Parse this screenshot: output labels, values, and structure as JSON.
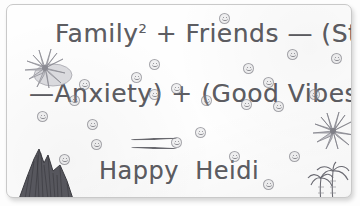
{
  "note": {
    "medium": "handwritten-pencil-note",
    "lines": [
      {
        "id": "line1",
        "text": "Family2 + Friends — (Stress"
      },
      {
        "id": "line2",
        "text": "—Anxiety) + (Good Vibes"
      },
      {
        "id": "line3",
        "text": "="
      },
      {
        "id": "line4",
        "text": "Happy Heidi"
      }
    ],
    "line1_base": "Family",
    "line1_superscript": "2",
    "line1_rest": " + Friends — (Stress",
    "line2_text": "—Anxiety) + (Good Vibes",
    "line4_text": "Happy  Heidi",
    "equation_plain": "Family² + Friends — (Stress — Anxiety) + (Good Vibes = Happy Heidi",
    "ink_color": "#5d5d62",
    "paper_color": "#fefefe",
    "border_color": "#c9c9c9"
  },
  "drawings": [
    {
      "name": "lotus-flower-left",
      "label": "water lily flower with leaf pad"
    },
    {
      "name": "lotus-flower-right",
      "label": "water lily flower"
    },
    {
      "name": "mountain",
      "label": "shaded rocky mountain peak"
    },
    {
      "name": "palm-trees",
      "label": "pair of palm trees"
    }
  ],
  "stamps": {
    "label": "smiley-face stamp",
    "count": 24,
    "positions": [
      [
        78,
        80
      ],
      [
        218,
        14
      ],
      [
        286,
        50
      ],
      [
        330,
        54
      ],
      [
        242,
        64
      ],
      [
        240,
        100
      ],
      [
        148,
        60
      ],
      [
        130,
        73
      ],
      [
        68,
        96
      ],
      [
        262,
        78
      ],
      [
        272,
        102
      ],
      [
        170,
        84
      ],
      [
        86,
        120
      ],
      [
        90,
        140
      ],
      [
        308,
        90
      ],
      [
        194,
        128
      ],
      [
        58,
        155
      ],
      [
        170,
        138
      ],
      [
        228,
        152
      ],
      [
        288,
        152
      ],
      [
        262,
        180
      ],
      [
        148,
        90
      ],
      [
        200,
        96
      ],
      [
        36,
        112
      ]
    ]
  }
}
